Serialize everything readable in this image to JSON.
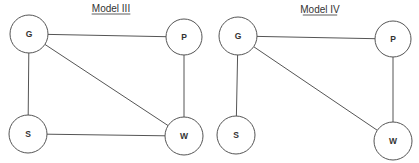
{
  "colors": {
    "background": "#ffffff",
    "stroke": "#555555",
    "text": "#333333"
  },
  "diagrams": [
    {
      "title": "Model III",
      "title_pos": [
        111,
        12
      ],
      "nodes": [
        {
          "id": "G",
          "label": "G",
          "cx": 29,
          "cy": 34,
          "r": 19
        },
        {
          "id": "P",
          "label": "P",
          "cx": 184,
          "cy": 37,
          "r": 18
        },
        {
          "id": "S",
          "label": "S",
          "cx": 28,
          "cy": 134,
          "r": 19
        },
        {
          "id": "W",
          "label": "W",
          "cx": 184,
          "cy": 136,
          "r": 19
        }
      ],
      "edges": [
        [
          "G",
          "P"
        ],
        [
          "G",
          "S"
        ],
        [
          "G",
          "W"
        ],
        [
          "P",
          "W"
        ],
        [
          "S",
          "W"
        ]
      ]
    },
    {
      "title": "Model IV",
      "title_pos": [
        320,
        13
      ],
      "nodes": [
        {
          "id": "G",
          "label": "G",
          "cx": 238,
          "cy": 36,
          "r": 19
        },
        {
          "id": "P",
          "label": "P",
          "cx": 393,
          "cy": 39,
          "r": 18
        },
        {
          "id": "S",
          "label": "S",
          "cx": 236,
          "cy": 135,
          "r": 19
        },
        {
          "id": "W",
          "label": "W",
          "cx": 393,
          "cy": 141,
          "r": 19
        }
      ],
      "edges": [
        [
          "G",
          "P"
        ],
        [
          "G",
          "S"
        ],
        [
          "G",
          "W"
        ],
        [
          "P",
          "W"
        ]
      ]
    }
  ]
}
